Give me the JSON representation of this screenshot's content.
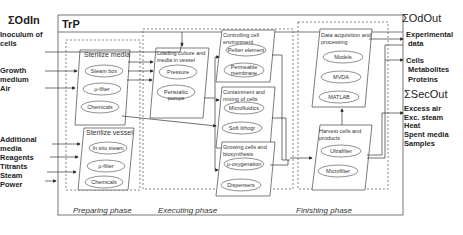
{
  "inputs": {
    "header": "ΣOdIn",
    "items": [
      "Inoculum of",
      "cells",
      "Growth",
      "medium",
      "Air",
      "Additional",
      "media",
      "Reagents",
      "Titrants",
      "Steam",
      "Power"
    ]
  },
  "process": {
    "title": "TrP",
    "phases": {
      "preparing": {
        "label": "Preparing phase",
        "boxes": [
          {
            "title": "Sterilize media",
            "items": [
              "Steam box",
              "μ-filter",
              "Chemicals"
            ]
          },
          {
            "title": "Sterilize vessel",
            "items": [
              "In situ steam",
              "μ-filter",
              "Chemicals"
            ]
          }
        ]
      },
      "executing": {
        "label": "Executing phase",
        "boxes": [
          {
            "title": "Loading culture and media in vessel",
            "items": [
              "Pressure",
              "Peristaltic pumps"
            ]
          },
          {
            "title": "Controlling cell environment",
            "items": [
              "Peltier element",
              "Permeable membrane"
            ]
          },
          {
            "title": "Containment and mixing of cells",
            "items": [
              "Microfluidics",
              "Soft lithogr"
            ]
          },
          {
            "title": "Growing cells and biosynthesis",
            "items": [
              "μ-oxygenation",
              "Dispensers"
            ]
          }
        ]
      },
      "finishing": {
        "label": "Finishing phase",
        "boxes": [
          {
            "title": "Data acquisition and processing",
            "items": [
              "Models",
              "MVDA",
              "MATLAB"
            ]
          },
          {
            "title": "Harvest cells and products",
            "items": [
              "Ultrafilter",
              "Microfilter"
            ]
          }
        ]
      }
    }
  },
  "outputs": {
    "od_header": "ΣOdOut",
    "od_items": [
      "Experimental",
      "data",
      "Cells",
      "Metabolites",
      "Proteins"
    ],
    "sec_header": "ΣSecOut",
    "sec_items": [
      "Excess air",
      "Exc. steam",
      "Heat",
      "Spent media",
      "Samples"
    ]
  }
}
